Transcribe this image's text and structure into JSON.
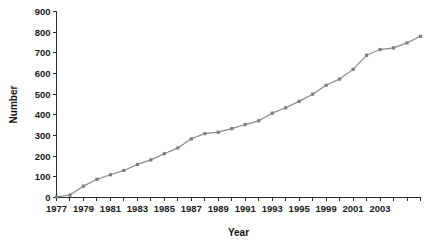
{
  "chart_data": {
    "type": "line",
    "title": "",
    "xlabel": "Year",
    "ylabel": "Number",
    "xlim": [
      1977,
      2004
    ],
    "ylim": [
      0,
      900
    ],
    "ytick_values": [
      0,
      100,
      200,
      300,
      400,
      500,
      600,
      700,
      800,
      900
    ],
    "ytick_labels": [
      "0",
      "100",
      "200",
      "300",
      "400",
      "500",
      "600",
      "700",
      "800",
      "900"
    ],
    "xtick_values": [
      1977,
      1978,
      1979,
      1980,
      1981,
      1982,
      1983,
      1984,
      1985,
      1986,
      1987,
      1988,
      1989,
      1990,
      1991,
      1992,
      1993,
      1994,
      1995,
      1996,
      1997,
      1998,
      1999,
      2000,
      2001,
      2002,
      2003,
      2004
    ],
    "xtick_labels": [
      {
        "value": 1977,
        "label": "1977"
      },
      {
        "value": 1979,
        "label": "1979"
      },
      {
        "value": 1981,
        "label": "1981"
      },
      {
        "value": 1983,
        "label": "1983"
      },
      {
        "value": 1985,
        "label": "1985"
      },
      {
        "value": 1987,
        "label": "1987"
      },
      {
        "value": 1989,
        "label": "1989"
      },
      {
        "value": 1991,
        "label": "1991"
      },
      {
        "value": 1993,
        "label": "1993"
      },
      {
        "value": 1995,
        "label": "1995"
      },
      {
        "value": 1997,
        "label": "1999"
      },
      {
        "value": 1999,
        "label": "2001"
      },
      {
        "value": 2001,
        "label": "2003"
      }
    ],
    "grid": false,
    "legend": false,
    "marker": "square",
    "line_color": "#8a8a8a",
    "marker_color": "#7d7d7d",
    "axis_color": "#2b2b2b",
    "x": [
      1977,
      1978,
      1979,
      1980,
      1981,
      1982,
      1983,
      1984,
      1985,
      1986,
      1987,
      1988,
      1989,
      1990,
      1991,
      1992,
      1993,
      1994,
      1995,
      1996,
      1997,
      1998,
      1999,
      2000,
      2001,
      2002,
      2003,
      2004
    ],
    "values": [
      3,
      12,
      55,
      88,
      110,
      131,
      160,
      182,
      212,
      240,
      284,
      309,
      316,
      333,
      353,
      371,
      408,
      434,
      465,
      500,
      543,
      573,
      620,
      688,
      716,
      724,
      748,
      780
    ],
    "series": [
      {
        "name": "Number",
        "values": [
          3,
          12,
          55,
          88,
          110,
          131,
          160,
          182,
          212,
          240,
          284,
          309,
          316,
          333,
          353,
          371,
          408,
          434,
          465,
          500,
          543,
          573,
          620,
          688,
          716,
          724,
          748,
          780
        ]
      }
    ]
  }
}
